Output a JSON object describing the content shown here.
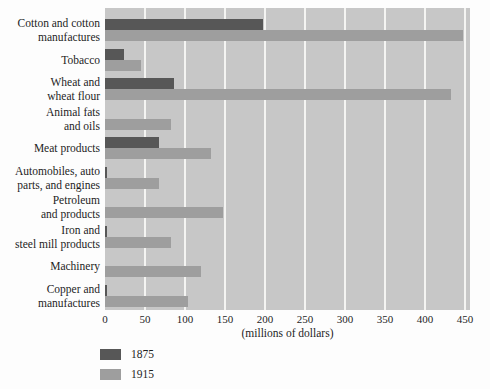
{
  "chart_data": {
    "type": "bar",
    "orientation": "horizontal",
    "title": "",
    "xlabel": "(millions of dollars)",
    "xlim": [
      0,
      450
    ],
    "xticks": [
      0,
      50,
      100,
      150,
      200,
      250,
      300,
      350,
      400,
      450
    ],
    "grid": true,
    "legend_position": "bottom-left",
    "categories": [
      "Cotton and cotton manufactures",
      "Tobacco",
      "Wheat and wheat flour",
      "Animal fats and oils",
      "Meat products",
      "Automobiles, auto parts, and engines",
      "Petroleum and products",
      "Iron and steel mill products",
      "Machinery",
      "Copper and manufactures"
    ],
    "category_lines": [
      [
        "Cotton and cotton",
        "manufactures"
      ],
      [
        "Tobacco"
      ],
      [
        "Wheat and",
        "wheat flour"
      ],
      [
        "Animal fats",
        "and oils"
      ],
      [
        "Meat products"
      ],
      [
        "Automobiles, auto",
        "parts, and engines"
      ],
      [
        "Petroleum",
        "and products"
      ],
      [
        "Iron and",
        "steel mill products"
      ],
      [
        "Machinery"
      ],
      [
        "Copper and",
        "manufactures"
      ]
    ],
    "series": [
      {
        "name": "1875",
        "color": "#575757",
        "values": [
          197,
          24,
          86,
          0,
          67,
          2,
          0,
          3,
          0,
          3
        ]
      },
      {
        "name": "1915",
        "color": "#9e9e9e",
        "values": [
          447,
          45,
          432,
          82,
          132,
          68,
          148,
          82,
          120,
          104
        ]
      }
    ]
  },
  "colors": {
    "page_bg": "#fdfdfd",
    "plot_bg": "#c7c7c7",
    "gridline": "#f4f4f2",
    "text": "#1e1e1e"
  }
}
